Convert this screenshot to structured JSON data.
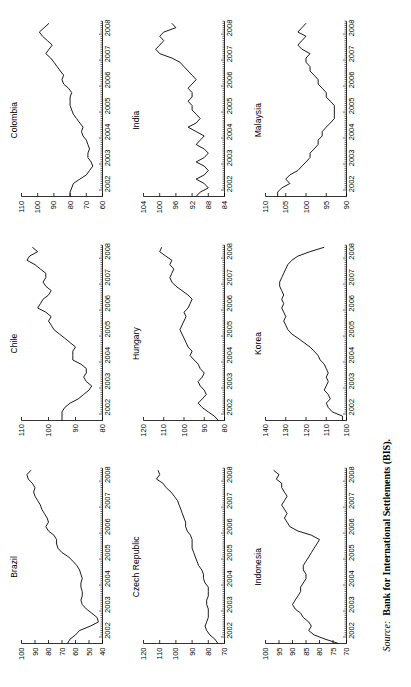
{
  "figure": {
    "orientation_deg": -90,
    "source_label": "Source:",
    "source_text": "Bank for International Settlements (BIS)."
  },
  "chart_data": [
    {
      "type": "line",
      "title": "Brazil",
      "xlabel": "",
      "ylabel": "",
      "grid": false,
      "legend": "none",
      "xlim": [
        2001.75,
        2008.5
      ],
      "ylim": [
        40,
        100
      ],
      "xticks": [
        "2002",
        "2003",
        "2004",
        "2005",
        "2006",
        "2007",
        "2008"
      ],
      "yticks": [
        100,
        90,
        80,
        70,
        60,
        50,
        40
      ],
      "x": [
        2001.75,
        2001.92,
        2002.08,
        2002.25,
        2002.42,
        2002.58,
        2002.75,
        2002.92,
        2003.08,
        2003.25,
        2003.42,
        2003.58,
        2003.75,
        2003.92,
        2004.08,
        2004.25,
        2004.42,
        2004.58,
        2004.75,
        2004.92,
        2005.08,
        2005.25,
        2005.42,
        2005.58,
        2005.75,
        2005.92,
        2006.08,
        2006.25,
        2006.42,
        2006.58,
        2006.75,
        2006.92,
        2007.08,
        2007.25,
        2007.42,
        2007.58,
        2007.75,
        2007.92,
        2008.08,
        2008.25,
        2008.42
      ],
      "values": [
        66,
        64,
        60,
        57,
        49,
        43,
        44,
        48,
        52,
        55,
        56,
        55,
        55,
        56,
        56,
        55,
        56,
        57,
        59,
        62,
        65,
        70,
        73,
        74,
        74,
        76,
        80,
        82,
        80,
        81,
        83,
        85,
        86,
        88,
        90,
        91,
        90,
        92,
        95,
        96,
        93
      ]
    },
    {
      "type": "line",
      "title": "Chile",
      "xlabel": "",
      "ylabel": "",
      "grid": false,
      "legend": "none",
      "xlim": [
        2001.75,
        2008.5
      ],
      "ylim": [
        80,
        110
      ],
      "xticks": [
        "2002",
        "2003",
        "2004",
        "2005",
        "2006",
        "2007",
        "2008"
      ],
      "yticks": [
        110,
        100,
        90,
        80
      ],
      "x": [
        2001.75,
        2001.92,
        2002.08,
        2002.25,
        2002.42,
        2002.58,
        2002.75,
        2002.92,
        2003.08,
        2003.25,
        2003.42,
        2003.58,
        2003.75,
        2003.92,
        2004.08,
        2004.25,
        2004.42,
        2004.58,
        2004.75,
        2004.92,
        2005.08,
        2005.25,
        2005.42,
        2005.58,
        2005.75,
        2005.92,
        2006.08,
        2006.25,
        2006.42,
        2006.58,
        2006.75,
        2006.92,
        2007.08,
        2007.25,
        2007.42,
        2007.58,
        2007.75,
        2007.92,
        2008.08,
        2008.25,
        2008.42
      ],
      "values": [
        95,
        95,
        95,
        94,
        92,
        89,
        87,
        85,
        84,
        86,
        87,
        86,
        86,
        88,
        91,
        91,
        91,
        90,
        92,
        94,
        96,
        98,
        99,
        100,
        99,
        101,
        104,
        103,
        102,
        100,
        99,
        101,
        102,
        101,
        101,
        103,
        105,
        108,
        107,
        104,
        106
      ]
    },
    {
      "type": "line",
      "title": "Colombia",
      "xlabel": "",
      "ylabel": "",
      "grid": false,
      "legend": "none",
      "xlim": [
        2001.75,
        2008.5
      ],
      "ylim": [
        60,
        110
      ],
      "xticks": [
        "2002",
        "2003",
        "2004",
        "2005",
        "2006",
        "2007",
        "2008"
      ],
      "yticks": [
        110,
        100,
        90,
        80,
        70,
        60
      ],
      "x": [
        2001.75,
        2001.92,
        2002.08,
        2002.25,
        2002.42,
        2002.58,
        2002.75,
        2002.92,
        2003.08,
        2003.25,
        2003.42,
        2003.58,
        2003.75,
        2003.92,
        2004.08,
        2004.25,
        2004.42,
        2004.58,
        2004.75,
        2004.92,
        2005.08,
        2005.25,
        2005.42,
        2005.58,
        2005.75,
        2005.92,
        2006.08,
        2006.25,
        2006.42,
        2006.58,
        2006.75,
        2006.92,
        2007.08,
        2007.25,
        2007.42,
        2007.58,
        2007.75,
        2007.92,
        2008.08,
        2008.25,
        2008.42
      ],
      "values": [
        80,
        80,
        79,
        78,
        74,
        70,
        68,
        66,
        67,
        69,
        69,
        68,
        69,
        70,
        72,
        73,
        72,
        74,
        76,
        78,
        79,
        80,
        80,
        80,
        79,
        81,
        84,
        85,
        84,
        86,
        88,
        90,
        92,
        95,
        93,
        91,
        94,
        97,
        99,
        96,
        93
      ]
    },
    {
      "type": "line",
      "title": "Czech Republic",
      "xlabel": "",
      "ylabel": "",
      "grid": false,
      "legend": "none",
      "xlim": [
        2001.75,
        2008.5
      ],
      "ylim": [
        70,
        120
      ],
      "xticks": [
        "2002",
        "2003",
        "2004",
        "2005",
        "2006",
        "2007",
        "2008"
      ],
      "yticks": [
        120,
        110,
        100,
        90,
        80,
        70
      ],
      "x": [
        2001.75,
        2001.92,
        2002.08,
        2002.25,
        2002.42,
        2002.58,
        2002.75,
        2002.92,
        2003.08,
        2003.25,
        2003.42,
        2003.58,
        2003.75,
        2003.92,
        2004.08,
        2004.25,
        2004.42,
        2004.58,
        2004.75,
        2004.92,
        2005.08,
        2005.25,
        2005.42,
        2005.58,
        2005.75,
        2005.92,
        2006.08,
        2006.25,
        2006.42,
        2006.58,
        2006.75,
        2006.92,
        2007.08,
        2007.25,
        2007.42,
        2007.58,
        2007.75,
        2007.92,
        2008.08,
        2008.25,
        2008.42
      ],
      "values": [
        74,
        76,
        79,
        81,
        82,
        81,
        80,
        80,
        80,
        81,
        81,
        80,
        80,
        80,
        82,
        83,
        83,
        84,
        86,
        87,
        88,
        89,
        90,
        90,
        90,
        91,
        93,
        94,
        94,
        95,
        96,
        97,
        98,
        99,
        101,
        103,
        106,
        108,
        112,
        110,
        111
      ]
    },
    {
      "type": "line",
      "title": "Hungary",
      "xlabel": "",
      "ylabel": "",
      "grid": false,
      "legend": "none",
      "xlim": [
        2001.75,
        2008.5
      ],
      "ylim": [
        80,
        120
      ],
      "xticks": [
        "2002",
        "2003",
        "2004",
        "2005",
        "2006",
        "2007",
        "2008"
      ],
      "yticks": [
        120,
        110,
        100,
        90,
        80
      ],
      "x": [
        2001.75,
        2001.92,
        2002.08,
        2002.25,
        2002.42,
        2002.58,
        2002.75,
        2002.92,
        2003.08,
        2003.25,
        2003.42,
        2003.58,
        2003.75,
        2003.92,
        2004.08,
        2004.25,
        2004.42,
        2004.58,
        2004.75,
        2004.92,
        2005.08,
        2005.25,
        2005.42,
        2005.58,
        2005.75,
        2005.92,
        2006.08,
        2006.25,
        2006.42,
        2006.58,
        2006.75,
        2006.92,
        2007.08,
        2007.25,
        2007.42,
        2007.58,
        2007.75,
        2007.92,
        2008.08,
        2008.25,
        2008.42
      ],
      "values": [
        83,
        85,
        88,
        91,
        93,
        91,
        89,
        90,
        92,
        93,
        91,
        90,
        92,
        93,
        95,
        97,
        96,
        98,
        99,
        100,
        101,
        102,
        101,
        100,
        99,
        100,
        98,
        97,
        96,
        98,
        101,
        104,
        106,
        107,
        106,
        105,
        107,
        106,
        109,
        112,
        111
      ]
    },
    {
      "type": "line",
      "title": "India",
      "xlabel": "",
      "ylabel": "",
      "grid": false,
      "legend": "none",
      "xlim": [
        2001.75,
        2008.5
      ],
      "ylim": [
        84,
        104
      ],
      "xticks": [
        "2002",
        "2003",
        "2004",
        "2005",
        "2006",
        "2007",
        "2008"
      ],
      "yticks": [
        104,
        100,
        96,
        92,
        88,
        84
      ],
      "x": [
        2001.75,
        2001.92,
        2002.08,
        2002.25,
        2002.42,
        2002.58,
        2002.75,
        2002.92,
        2003.08,
        2003.25,
        2003.42,
        2003.58,
        2003.75,
        2003.92,
        2004.08,
        2004.25,
        2004.42,
        2004.58,
        2004.75,
        2004.92,
        2005.08,
        2005.25,
        2005.42,
        2005.58,
        2005.75,
        2005.92,
        2006.08,
        2006.25,
        2006.42,
        2006.58,
        2006.75,
        2006.92,
        2007.08,
        2007.25,
        2007.42,
        2007.58,
        2007.75,
        2007.92,
        2008.08,
        2008.25,
        2008.42
      ],
      "values": [
        91,
        90,
        88,
        89,
        91,
        89,
        88,
        89,
        91,
        89,
        88,
        89,
        91,
        90,
        89,
        91,
        93,
        91,
        90,
        91,
        92,
        92,
        93,
        92,
        92,
        93,
        92,
        91,
        92,
        93,
        94,
        95,
        97,
        100,
        101,
        100,
        99,
        100,
        99,
        96,
        97
      ]
    },
    {
      "type": "line",
      "title": "Indonesia",
      "xlabel": "",
      "ylabel": "",
      "grid": false,
      "legend": "none",
      "xlim": [
        2001.75,
        2008.5
      ],
      "ylim": [
        70,
        100
      ],
      "xticks": [
        "2002",
        "2003",
        "2004",
        "2005",
        "2006",
        "2007",
        "2008"
      ],
      "yticks": [
        100,
        95,
        90,
        85,
        80,
        75,
        70
      ],
      "x": [
        2001.75,
        2001.92,
        2002.08,
        2002.25,
        2002.42,
        2002.58,
        2002.75,
        2002.92,
        2003.08,
        2003.25,
        2003.42,
        2003.58,
        2003.75,
        2003.92,
        2004.08,
        2004.25,
        2004.42,
        2004.58,
        2004.75,
        2004.92,
        2005.08,
        2005.25,
        2005.42,
        2005.58,
        2005.75,
        2005.92,
        2006.08,
        2006.25,
        2006.42,
        2006.58,
        2006.75,
        2006.92,
        2007.08,
        2007.25,
        2007.42,
        2007.58,
        2007.75,
        2007.92,
        2008.08,
        2008.25,
        2008.42
      ],
      "values": [
        73,
        78,
        82,
        84,
        83,
        84,
        86,
        87,
        89,
        90,
        89,
        88,
        87,
        87,
        86,
        85,
        85,
        86,
        86,
        85,
        84,
        83,
        82,
        81,
        80,
        83,
        88,
        91,
        92,
        93,
        92,
        93,
        94,
        93,
        92,
        93,
        94,
        94,
        96,
        95,
        97
      ]
    },
    {
      "type": "line",
      "title": "Korea",
      "xlabel": "",
      "ylabel": "",
      "grid": false,
      "legend": "none",
      "xlim": [
        2001.75,
        2008.5
      ],
      "ylim": [
        100,
        140
      ],
      "xticks": [
        "2002",
        "2003",
        "2004",
        "2005",
        "2006",
        "2007",
        "2008"
      ],
      "yticks": [
        140,
        130,
        120,
        110,
        100
      ],
      "x": [
        2001.75,
        2001.92,
        2002.08,
        2002.25,
        2002.42,
        2002.58,
        2002.75,
        2002.92,
        2003.08,
        2003.25,
        2003.42,
        2003.58,
        2003.75,
        2003.92,
        2004.08,
        2004.25,
        2004.42,
        2004.58,
        2004.75,
        2004.92,
        2005.08,
        2005.25,
        2005.42,
        2005.58,
        2005.75,
        2005.92,
        2006.08,
        2006.25,
        2006.42,
        2006.58,
        2006.75,
        2006.92,
        2007.08,
        2007.25,
        2007.42,
        2007.58,
        2007.75,
        2007.92,
        2008.08,
        2008.25,
        2008.42
      ],
      "values": [
        102,
        102,
        107,
        109,
        110,
        108,
        109,
        111,
        110,
        109,
        110,
        109,
        110,
        111,
        113,
        114,
        116,
        118,
        121,
        124,
        127,
        129,
        130,
        131,
        130,
        131,
        132,
        131,
        132,
        131,
        132,
        133,
        133,
        132,
        131,
        130,
        129,
        127,
        124,
        118,
        111
      ]
    },
    {
      "type": "line",
      "title": "Malaysia",
      "xlabel": "",
      "ylabel": "",
      "grid": false,
      "legend": "none",
      "xlim": [
        2001.75,
        2008.5
      ],
      "ylim": [
        90,
        110
      ],
      "xticks": [
        "2002",
        "2003",
        "2004",
        "2005",
        "2006",
        "2007",
        "2008"
      ],
      "yticks": [
        110,
        105,
        100,
        95,
        90
      ],
      "x": [
        2001.75,
        2001.92,
        2002.08,
        2002.25,
        2002.42,
        2002.58,
        2002.75,
        2002.92,
        2003.08,
        2003.25,
        2003.42,
        2003.58,
        2003.75,
        2003.92,
        2004.08,
        2004.25,
        2004.42,
        2004.58,
        2004.75,
        2004.92,
        2005.08,
        2005.25,
        2005.42,
        2005.58,
        2005.75,
        2005.92,
        2006.08,
        2006.25,
        2006.42,
        2006.58,
        2006.75,
        2006.92,
        2007.08,
        2007.25,
        2007.42,
        2007.58,
        2007.75,
        2007.92,
        2008.08,
        2008.25,
        2008.42
      ],
      "values": [
        107,
        107,
        106,
        104,
        105,
        104,
        102,
        101,
        100,
        99,
        99,
        98,
        97,
        97,
        96,
        96,
        95,
        94,
        93,
        93,
        93,
        93,
        94,
        95,
        95,
        96,
        97,
        97,
        98,
        99,
        99,
        100,
        100,
        99,
        101,
        102,
        101,
        100,
        102,
        101,
        100
      ]
    }
  ]
}
